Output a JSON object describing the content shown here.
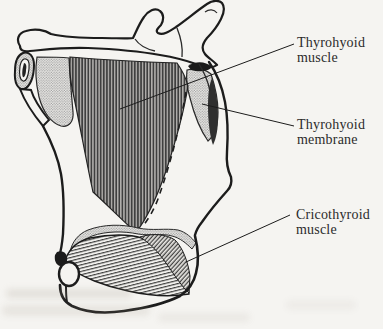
{
  "colors": {
    "ink": "#1c1c1c",
    "paper": "#f5f4f1",
    "muscle_hatch": "#3f3f3f",
    "stipple_gray": "#8f8f8f"
  },
  "annotations": [
    {
      "id": "thyrohyoid-muscle",
      "line1": "Thyrohyoid",
      "line2": "muscle"
    },
    {
      "id": "thyrohyoid-membrane",
      "line1": "Thyrohyoid",
      "line2": "membrane"
    },
    {
      "id": "cricothyroid-muscle",
      "line1": "Cricothyroid",
      "line2": "muscle"
    }
  ]
}
